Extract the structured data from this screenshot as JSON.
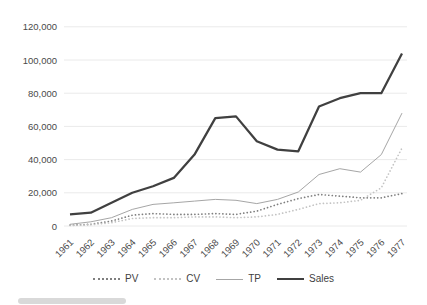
{
  "chart_data": {
    "type": "line",
    "title": "",
    "xlabel": "",
    "ylabel": "",
    "x": [
      "1961",
      "1962",
      "1963",
      "1964",
      "1965",
      "1966",
      "1967",
      "1968",
      "1969",
      "1970",
      "1971",
      "1972",
      "1973",
      "1974",
      "1975",
      "1976",
      "1977"
    ],
    "series": [
      {
        "name": "PV",
        "color": "#7f7f7f",
        "style": "dotted",
        "width": 1.7,
        "values": [
          500,
          1000,
          3000,
          6500,
          7500,
          7000,
          7000,
          7500,
          7000,
          9000,
          13000,
          16500,
          19000,
          18000,
          17000,
          17000,
          19500
        ]
      },
      {
        "name": "CV",
        "color": "#c3c3c3",
        "style": "dotted",
        "width": 1.7,
        "values": [
          300,
          800,
          2000,
          4500,
          5000,
          5000,
          5500,
          5500,
          5000,
          5500,
          7000,
          10000,
          13500,
          14000,
          15500,
          23000,
          47000
        ]
      },
      {
        "name": "TP",
        "color": "#a6a6a6",
        "style": "solid",
        "width": 1,
        "values": [
          1000,
          2500,
          5000,
          10000,
          13000,
          14000,
          15000,
          16000,
          15500,
          13500,
          16000,
          20500,
          31000,
          34500,
          32500,
          43000,
          68000
        ]
      },
      {
        "name": "Sales",
        "color": "#404040",
        "style": "solid",
        "width": 2.25,
        "values": [
          7000,
          8000,
          14000,
          20000,
          24000,
          29000,
          43000,
          65000,
          66000,
          51000,
          46000,
          45000,
          72000,
          77000,
          80000,
          80000,
          104000
        ]
      }
    ],
    "ylim": [
      0,
      120000
    ],
    "ytick_step": 20000,
    "ytick_labels": [
      "0",
      "20,000",
      "40,000",
      "60,000",
      "80,000",
      "100,000",
      "120,000"
    ],
    "grid": "horizontal",
    "grid_color": "#eaeaea",
    "axis_label_color": "#4a4a4a",
    "legend_position": "bottom"
  }
}
